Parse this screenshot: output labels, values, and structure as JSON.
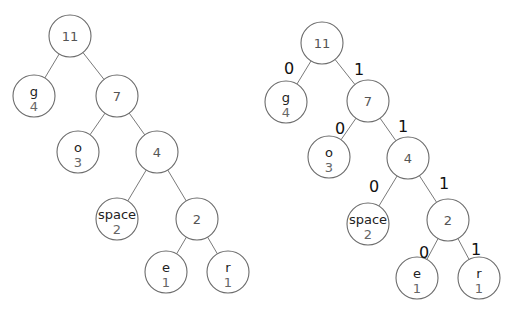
{
  "diagram": {
    "type": "huffman-tree",
    "node_radius": 21,
    "colors": {
      "stroke": "#6b6b6b",
      "edge": "#7a7a7a",
      "symbol": "#222222",
      "weight": "#666666",
      "bit": "#111111"
    },
    "trees": [
      {
        "id": "tree-unlabeled",
        "show_bits": false,
        "nodes": [
          {
            "id": "n11",
            "label": "11",
            "x": 70,
            "y": 36
          },
          {
            "id": "g",
            "symbol": "g",
            "weight": "4",
            "x": 34,
            "y": 96
          },
          {
            "id": "n7",
            "label": "7",
            "x": 117,
            "y": 96
          },
          {
            "id": "o",
            "symbol": "o",
            "weight": "3",
            "x": 78,
            "y": 152
          },
          {
            "id": "n4",
            "label": "4",
            "x": 157,
            "y": 152
          },
          {
            "id": "space",
            "symbol": "space",
            "weight": "2",
            "x": 117,
            "y": 219
          },
          {
            "id": "n2",
            "label": "2",
            "x": 197,
            "y": 219
          },
          {
            "id": "e",
            "symbol": "e",
            "weight": "1",
            "x": 166,
            "y": 272
          },
          {
            "id": "r",
            "symbol": "r",
            "weight": "1",
            "x": 228,
            "y": 272
          }
        ],
        "edges": [
          {
            "from": "n11",
            "to": "g"
          },
          {
            "from": "n11",
            "to": "n7"
          },
          {
            "from": "n7",
            "to": "o"
          },
          {
            "from": "n7",
            "to": "n4"
          },
          {
            "from": "n4",
            "to": "space"
          },
          {
            "from": "n4",
            "to": "n2"
          },
          {
            "from": "n2",
            "to": "e"
          },
          {
            "from": "n2",
            "to": "r"
          }
        ]
      },
      {
        "id": "tree-labeled",
        "show_bits": true,
        "nodes": [
          {
            "id": "n11",
            "label": "11",
            "x": 322,
            "y": 43
          },
          {
            "id": "g",
            "symbol": "g",
            "weight": "4",
            "x": 286,
            "y": 102
          },
          {
            "id": "n7",
            "label": "7",
            "x": 368,
            "y": 101
          },
          {
            "id": "o",
            "symbol": "o",
            "weight": "3",
            "x": 329,
            "y": 157
          },
          {
            "id": "n4",
            "label": "4",
            "x": 408,
            "y": 158
          },
          {
            "id": "space",
            "symbol": "space",
            "weight": "2",
            "x": 368,
            "y": 224
          },
          {
            "id": "n2",
            "label": "2",
            "x": 448,
            "y": 220
          },
          {
            "id": "e",
            "symbol": "e",
            "weight": "1",
            "x": 417,
            "y": 278
          },
          {
            "id": "r",
            "symbol": "r",
            "weight": "1",
            "x": 479,
            "y": 278
          }
        ],
        "edges": [
          {
            "from": "n11",
            "to": "g",
            "bit": "0",
            "bx": 289,
            "by": 68
          },
          {
            "from": "n11",
            "to": "n7",
            "bit": "1",
            "bx": 359,
            "by": 69
          },
          {
            "from": "n7",
            "to": "o",
            "bit": "0",
            "bx": 340,
            "by": 128
          },
          {
            "from": "n7",
            "to": "n4",
            "bit": "1",
            "bx": 403,
            "by": 126
          },
          {
            "from": "n4",
            "to": "space",
            "bit": "0",
            "bx": 374,
            "by": 186
          },
          {
            "from": "n4",
            "to": "n2",
            "bit": "1",
            "bx": 444,
            "by": 183
          },
          {
            "from": "n2",
            "to": "e",
            "bit": "0",
            "bx": 424,
            "by": 252
          },
          {
            "from": "n2",
            "to": "r",
            "bit": "1",
            "bx": 476,
            "by": 249
          }
        ]
      }
    ]
  }
}
